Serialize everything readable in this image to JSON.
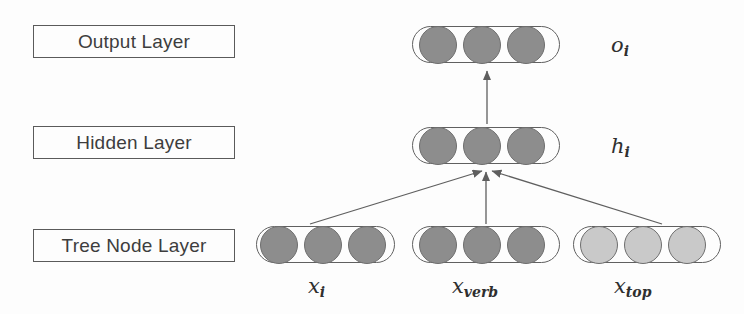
{
  "figure": {
    "type": "neural-network-architecture-diagram",
    "background_color": "#fdfdfd",
    "stroke_color": "#5a5a5a",
    "node_dark_color": "#8d8d8d",
    "node_light_color": "#c9c9c9"
  },
  "layer_boxes": [
    {
      "id": "output",
      "label": "Output Layer"
    },
    {
      "id": "hidden",
      "label": "Hidden Layer"
    },
    {
      "id": "tree",
      "label": "Tree Node Layer"
    }
  ],
  "node_groups": [
    {
      "id": "output",
      "layer": "Output Layer",
      "node_count": 3,
      "shade": "dark",
      "label_base": "o",
      "label_sub": "i"
    },
    {
      "id": "hidden",
      "layer": "Hidden Layer",
      "node_count": 3,
      "shade": "dark",
      "label_base": "h",
      "label_sub": "i"
    },
    {
      "id": "x_i",
      "layer": "Tree Node Layer",
      "node_count": 3,
      "shade": "dark",
      "label_base": "x",
      "label_sub": "i"
    },
    {
      "id": "x_verb",
      "layer": "Tree Node Layer",
      "node_count": 3,
      "shade": "dark",
      "label_base": "x",
      "label_sub": "verb"
    },
    {
      "id": "x_top",
      "layer": "Tree Node Layer",
      "node_count": 3,
      "shade": "light",
      "label_base": "x",
      "label_sub": "top"
    }
  ],
  "edges": [
    {
      "from": "x_i",
      "to": "hidden",
      "style": "arrow"
    },
    {
      "from": "x_verb",
      "to": "hidden",
      "style": "arrow"
    },
    {
      "from": "x_top",
      "to": "hidden",
      "style": "arrow"
    },
    {
      "from": "hidden",
      "to": "output",
      "style": "arrow"
    }
  ]
}
